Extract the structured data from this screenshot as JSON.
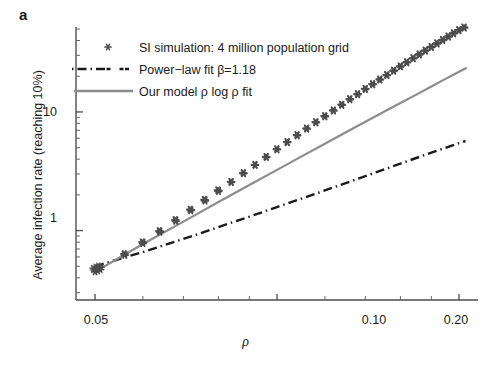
{
  "figure": {
    "panel_label": "a",
    "background": "#ffffff"
  },
  "chart_data": {
    "type": "scatter",
    "title": "",
    "xlabel": "ρ",
    "ylabel": "Average infection rate (reaching 10%)",
    "xscale": "log",
    "yscale": "log",
    "xlim": [
      0.0465,
      0.215
    ],
    "ylim": [
      0.26,
      52
    ],
    "grid": false,
    "legend_position": "upper-left",
    "xticks": [
      {
        "value": 0.05,
        "label": "0.05"
      },
      {
        "value": 0.1,
        "label": "0.10"
      },
      {
        "value": 0.2,
        "label": "0.20"
      }
    ],
    "xminor_ticks": [
      0.06,
      0.07,
      0.08,
      0.09,
      0.12,
      0.14,
      0.16,
      0.18
    ],
    "yticks": [
      {
        "value": 1,
        "label": "1"
      },
      {
        "value": 10,
        "label": "10"
      }
    ],
    "yminor_ticks": [
      0.3,
      0.4,
      0.5,
      0.6,
      0.7,
      0.8,
      0.9,
      2,
      3,
      4,
      5,
      6,
      7,
      8,
      9,
      20,
      30,
      40,
      50
    ],
    "series": [
      {
        "name": "SI simulation: 4 million population grid",
        "type": "scatter",
        "marker": "asterisk",
        "color": "#4d4d4d",
        "points": [
          {
            "x": 0.05,
            "y": 0.45
          },
          {
            "x": 0.0505,
            "y": 0.46
          },
          {
            "x": 0.051,
            "y": 0.47
          },
          {
            "x": 0.056,
            "y": 0.62
          },
          {
            "x": 0.06,
            "y": 0.78
          },
          {
            "x": 0.064,
            "y": 0.97
          },
          {
            "x": 0.068,
            "y": 1.2
          },
          {
            "x": 0.072,
            "y": 1.47
          },
          {
            "x": 0.076,
            "y": 1.78
          },
          {
            "x": 0.08,
            "y": 2.14
          },
          {
            "x": 0.084,
            "y": 2.55
          },
          {
            "x": 0.088,
            "y": 3.02
          },
          {
            "x": 0.092,
            "y": 3.55
          },
          {
            "x": 0.096,
            "y": 4.14
          },
          {
            "x": 0.1,
            "y": 4.8
          },
          {
            "x": 0.104,
            "y": 5.52
          },
          {
            "x": 0.108,
            "y": 6.32
          },
          {
            "x": 0.112,
            "y": 7.18
          },
          {
            "x": 0.116,
            "y": 8.12
          },
          {
            "x": 0.12,
            "y": 9.13
          },
          {
            "x": 0.124,
            "y": 10.2
          },
          {
            "x": 0.128,
            "y": 11.4
          },
          {
            "x": 0.132,
            "y": 12.7
          },
          {
            "x": 0.136,
            "y": 14.0
          },
          {
            "x": 0.14,
            "y": 15.5
          },
          {
            "x": 0.144,
            "y": 17.0
          },
          {
            "x": 0.148,
            "y": 18.6
          },
          {
            "x": 0.152,
            "y": 20.3
          },
          {
            "x": 0.156,
            "y": 22.1
          },
          {
            "x": 0.16,
            "y": 24.0
          },
          {
            "x": 0.164,
            "y": 26.0
          },
          {
            "x": 0.168,
            "y": 28.1
          },
          {
            "x": 0.172,
            "y": 30.3
          },
          {
            "x": 0.176,
            "y": 32.6
          },
          {
            "x": 0.18,
            "y": 35.0
          },
          {
            "x": 0.184,
            "y": 37.5
          },
          {
            "x": 0.188,
            "y": 40.1
          },
          {
            "x": 0.192,
            "y": 42.8
          },
          {
            "x": 0.196,
            "y": 45.6
          },
          {
            "x": 0.2,
            "y": 48.5
          },
          {
            "x": 0.204,
            "y": 51.0
          }
        ]
      },
      {
        "name": "Power-law fit",
        "label_html": "Power−law fit <i>β</i>=1.18",
        "type": "line",
        "linestyle": "dashdot",
        "color": "#1a1a1a",
        "beta": 1.18,
        "x": [
          0.05,
          0.06,
          0.07,
          0.08,
          0.09,
          0.1,
          0.12,
          0.14,
          0.16,
          0.18,
          0.205
        ],
        "y": [
          0.5,
          0.66,
          0.85,
          1.07,
          1.31,
          1.58,
          2.18,
          2.88,
          3.67,
          4.54,
          5.69
        ]
      },
      {
        "name": "Our model rho log rho fit",
        "label_html": "Our model <i>ρ</i> log <i>ρ</i> fit",
        "type": "line",
        "linestyle": "solid",
        "color": "#8c8c8c",
        "x": [
          0.05,
          0.06,
          0.07,
          0.08,
          0.09,
          0.1,
          0.11,
          0.12,
          0.13,
          0.14,
          0.15,
          0.16,
          0.17,
          0.18,
          0.19,
          0.2,
          0.206
        ],
        "y": [
          0.45,
          0.77,
          1.19,
          1.74,
          2.42,
          3.25,
          4.24,
          5.4,
          6.74,
          8.27,
          10.0,
          11.9,
          14.0,
          16.4,
          19.0,
          21.8,
          23.6
        ]
      }
    ]
  },
  "legend": {
    "items": [
      {
        "label": "SI simulation: 4 million population grid",
        "marker": "asterisk",
        "color": "#4d4d4d"
      },
      {
        "label": "Power−law fit β=1.18",
        "marker": "dashdot-line",
        "color": "#1a1a1a"
      },
      {
        "label": "Our model ρ log ρ fit",
        "marker": "solid-line",
        "color": "#8c8c8c"
      }
    ]
  },
  "axes": {
    "x_tick_labels": [
      "0.05",
      "0.10",
      "0.20"
    ],
    "y_tick_labels": [
      "10",
      "1"
    ],
    "x_axis_title": "ρ",
    "y_axis_title": "Average infection rate (reaching 10%)"
  }
}
